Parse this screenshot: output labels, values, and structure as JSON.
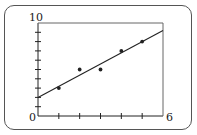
{
  "chart_data": {
    "type": "scatter",
    "title": "",
    "xlabel": "",
    "ylabel": "",
    "xlim": [
      0,
      6
    ],
    "ylim": [
      0,
      10
    ],
    "x_ticks": [
      0,
      1,
      2,
      3,
      4,
      5,
      6
    ],
    "y_ticks": [
      0,
      1,
      2,
      3,
      4,
      5,
      6,
      7,
      8,
      9,
      10
    ],
    "tick_labels": {
      "y_max": "10",
      "origin": "0",
      "x_max": "6"
    },
    "grid": false,
    "legend": null,
    "series": [
      {
        "name": "data points",
        "type": "scatter",
        "x": [
          1,
          2,
          3,
          4,
          5
        ],
        "y": [
          3,
          5,
          5,
          7,
          8
        ]
      },
      {
        "name": "line of best fit",
        "type": "line",
        "slope": 1.2,
        "intercept": 2.0,
        "x": [
          0,
          6
        ],
        "y": [
          2.0,
          9.2
        ]
      }
    ]
  },
  "colors": {
    "ink": "#222222",
    "frame": "#555555",
    "background": "#ffffff"
  }
}
